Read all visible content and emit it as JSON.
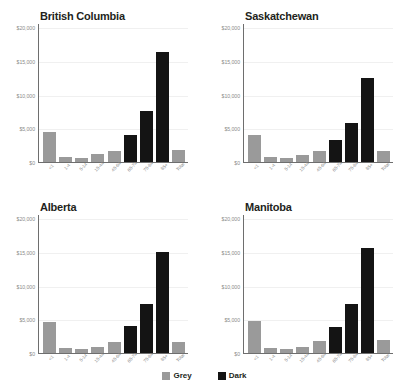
{
  "chart_data": {
    "type": "bar",
    "title": "",
    "xlabel": "",
    "ylabel": "",
    "ylim": [
      0,
      20000
    ],
    "yticks": [
      0,
      5000,
      10000,
      15000,
      20000
    ],
    "ytick_labels": [
      "$0",
      "$5,000",
      "$10,000",
      "$15,000",
      "$20,000"
    ],
    "grid": true,
    "categories": [
      "<1",
      "1-4",
      "5-14",
      "15-44",
      "45-64",
      "65-74",
      "75-84",
      "85+",
      "Total"
    ],
    "colors": {
      "grey_bar": "#9a9a9a",
      "dark_bar": "#141414",
      "axis": "#6e6e6e",
      "gridline": "#f0f0f0",
      "tick_text": "#8b8b8b",
      "title_text": "#231f20"
    },
    "bar_colors": [
      "grey",
      "grey",
      "grey",
      "grey",
      "grey",
      "dark",
      "dark",
      "dark",
      "grey"
    ],
    "legend": {
      "position": "bottom",
      "entries": [
        {
          "label": "Grey",
          "color": "#9a9a9a"
        },
        {
          "label": "Dark",
          "color": "#141414"
        }
      ]
    },
    "panels": [
      {
        "title": "British Columbia",
        "values": [
          4500,
          800,
          650,
          1150,
          1650,
          3950,
          7500,
          16300,
          1850
        ]
      },
      {
        "title": "Saskatchewan",
        "values": [
          3950,
          800,
          600,
          1050,
          1600,
          3300,
          5750,
          12450,
          1700
        ]
      },
      {
        "title": "Alberta",
        "values": [
          4650,
          800,
          650,
          950,
          1650,
          3950,
          7200,
          14900,
          1650
        ]
      },
      {
        "title": "Manitoba",
        "values": [
          4800,
          700,
          550,
          900,
          1750,
          3800,
          7200,
          15500,
          1950
        ]
      }
    ]
  },
  "legend_strip": {
    "items": [
      {
        "label": "Grey"
      },
      {
        "label": "Dark"
      }
    ]
  }
}
